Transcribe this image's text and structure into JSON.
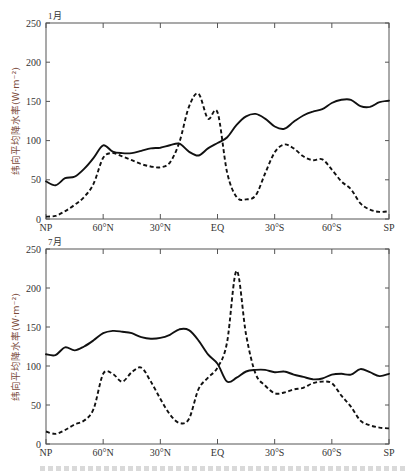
{
  "chart_data": [
    {
      "type": "line",
      "title": "1月",
      "xlabel": "",
      "ylabel": "纬向平均降水率(W·m⁻²)",
      "ylim": [
        0,
        250
      ],
      "yticks": [
        0,
        50,
        100,
        150,
        200,
        250
      ],
      "xticks": [
        "NP",
        "60°N",
        "30°N",
        "EQ",
        "30°S",
        "60°S",
        "SP"
      ],
      "grid": false,
      "legend": null,
      "x": [
        90,
        85,
        80,
        75,
        70,
        65,
        60,
        55,
        50,
        45,
        40,
        35,
        30,
        25,
        20,
        15,
        10,
        5,
        0,
        -5,
        -10,
        -15,
        -20,
        -25,
        -30,
        -35,
        -40,
        -45,
        -50,
        -55,
        -60,
        -65,
        -70,
        -75,
        -80,
        -85,
        -90
      ],
      "series": [
        {
          "name": "solid",
          "style": "solid",
          "values": [
            48,
            43,
            52,
            54,
            64,
            78,
            94,
            86,
            84,
            84,
            87,
            90,
            91,
            94,
            96,
            86,
            81,
            90,
            97,
            104,
            120,
            131,
            134,
            128,
            118,
            115,
            124,
            132,
            137,
            140,
            148,
            152,
            152,
            144,
            143,
            149,
            151
          ]
        },
        {
          "name": "dashed",
          "style": "dashed",
          "values": [
            3,
            4,
            10,
            18,
            28,
            45,
            78,
            84,
            80,
            75,
            70,
            67,
            66,
            72,
            98,
            143,
            160,
            128,
            136,
            60,
            28,
            25,
            30,
            58,
            85,
            95,
            90,
            80,
            75,
            76,
            63,
            48,
            38,
            20,
            12,
            9,
            10
          ]
        }
      ]
    },
    {
      "type": "line",
      "title": "7月",
      "xlabel": "",
      "ylabel": "纬向平均降水率(W·m⁻²)",
      "ylim": [
        0,
        250
      ],
      "yticks": [
        0,
        50,
        100,
        150,
        200,
        250
      ],
      "xticks": [
        "NP",
        "60°N",
        "30°N",
        "EQ",
        "30°S",
        "60°S",
        "SP"
      ],
      "grid": false,
      "legend": null,
      "x": [
        90,
        85,
        80,
        75,
        70,
        65,
        60,
        55,
        50,
        45,
        40,
        35,
        30,
        25,
        20,
        15,
        10,
        5,
        0,
        -5,
        -10,
        -15,
        -20,
        -25,
        -30,
        -35,
        -40,
        -45,
        -50,
        -55,
        -60,
        -65,
        -70,
        -75,
        -80,
        -85,
        -90
      ],
      "series": [
        {
          "name": "solid",
          "style": "solid",
          "values": [
            115,
            114,
            124,
            120,
            125,
            133,
            142,
            145,
            144,
            142,
            137,
            135,
            136,
            140,
            147,
            146,
            133,
            115,
            103,
            80,
            85,
            93,
            95,
            95,
            92,
            93,
            89,
            86,
            83,
            84,
            89,
            90,
            89,
            96,
            92,
            87,
            90
          ]
        },
        {
          "name": "dashed",
          "style": "dashed",
          "values": [
            16,
            13,
            18,
            25,
            30,
            45,
            90,
            90,
            80,
            92,
            98,
            80,
            58,
            38,
            27,
            32,
            70,
            85,
            98,
            130,
            222,
            140,
            90,
            75,
            65,
            66,
            70,
            72,
            78,
            80,
            78,
            62,
            48,
            30,
            24,
            21,
            20
          ]
        }
      ]
    }
  ],
  "panels": [
    {
      "title": "1月",
      "ylabel": "纬向平均降水率(W·m⁻²)",
      "yticks": [
        "0",
        "50",
        "100",
        "150",
        "200",
        "250"
      ],
      "xticks": [
        "NP",
        "60°N",
        "30°N",
        "EQ",
        "30°S",
        "60°S",
        "SP"
      ]
    },
    {
      "title": "7月",
      "ylabel": "纬向平均降水率(W·m⁻²)",
      "yticks": [
        "0",
        "50",
        "100",
        "150",
        "200",
        "250"
      ],
      "xticks": [
        "NP",
        "60°N",
        "30°N",
        "EQ",
        "30°S",
        "60°S",
        "SP"
      ]
    }
  ]
}
